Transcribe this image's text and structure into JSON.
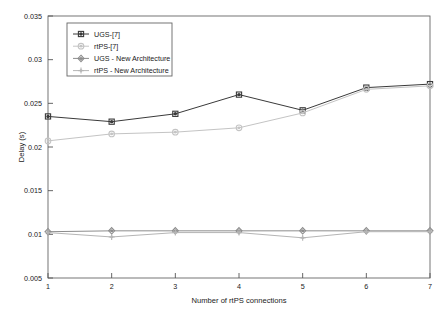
{
  "chart_data": {
    "type": "line",
    "title": "",
    "xlabel": "Number of rtPS connections",
    "ylabel": "Delay (s)",
    "x": [
      1,
      2,
      3,
      4,
      5,
      6,
      7
    ],
    "xlim": [
      1,
      7
    ],
    "ylim": [
      0.005,
      0.035
    ],
    "xticks": [
      "1",
      "2",
      "3",
      "4",
      "5",
      "6",
      "7"
    ],
    "yticks": [
      "0.005",
      "0.01",
      "0.015",
      "0.02",
      "0.025",
      "0.03",
      "0.035"
    ],
    "ytick_values": [
      0.005,
      0.01,
      0.015,
      0.02,
      0.025,
      0.03,
      0.035
    ],
    "grid": false,
    "legend_position": "upper left",
    "series": [
      {
        "name": "UGS-[7]",
        "values": [
          0.0235,
          0.0229,
          0.0238,
          0.026,
          0.0242,
          0.0268,
          0.0272
        ],
        "color": "#3a3a3a",
        "marker": "square-dot"
      },
      {
        "name": "rtPS-[7]",
        "values": [
          0.0207,
          0.0215,
          0.0217,
          0.0222,
          0.0239,
          0.0266,
          0.027
        ],
        "color": "#c4c4c4",
        "marker": "circle-dot"
      },
      {
        "name": "UGS - New Architecture",
        "values": [
          0.0103,
          0.0104,
          0.0104,
          0.0104,
          0.0104,
          0.0104,
          0.0104
        ],
        "color": "#8c8c8c",
        "marker": "diamond-dot"
      },
      {
        "name": "rtPS - New Architecture",
        "values": [
          0.0102,
          0.0097,
          0.0102,
          0.0102,
          0.0096,
          0.0103,
          0.0103
        ],
        "color": "#b5b5b5",
        "marker": "plus-dot"
      }
    ]
  },
  "axes": {
    "ylabel": "Delay (s)",
    "xlabel": "Number of rtPS connections",
    "yticks": [
      "0.035",
      "0.03",
      "0.025",
      "0.02",
      "0.015",
      "0.01",
      "0.005"
    ],
    "xticks": [
      "1",
      "2",
      "3",
      "4",
      "5",
      "6",
      "7"
    ]
  },
  "legend": {
    "items": [
      {
        "label": "UGS-[7]"
      },
      {
        "label": "rtPS-[7]"
      },
      {
        "label": "UGS - New Architecture"
      },
      {
        "label": "rtPS - New Architecture"
      }
    ]
  },
  "colors": {
    "series1": "#3a3a3a",
    "series2": "#c4c4c4",
    "series3": "#8c8c8c",
    "series4": "#b5b5b5",
    "axis": "#555555",
    "background": "#ffffff"
  }
}
